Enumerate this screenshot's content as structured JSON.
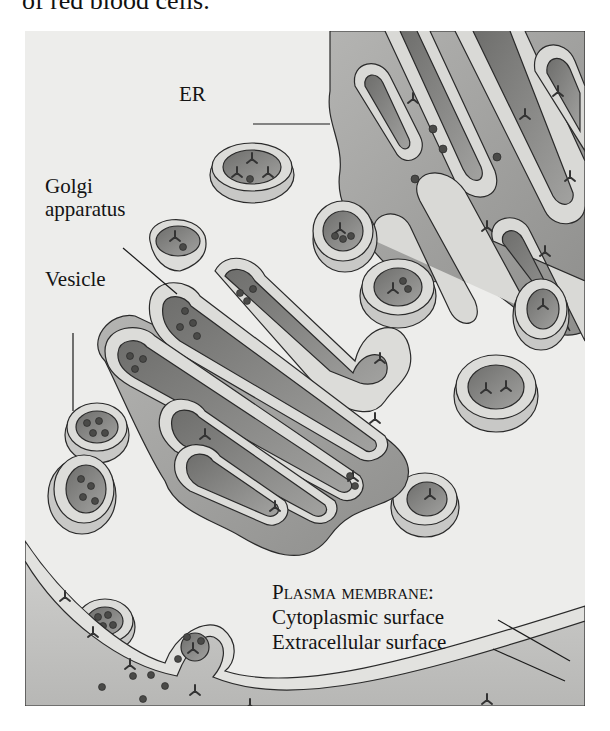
{
  "page": {
    "top_text": "of red blood cells."
  },
  "figure": {
    "background": "#ededeb",
    "organelle_fill": "#9d9d9b",
    "lumen_fill": "#7d7d7b",
    "membrane_fill": "#d9d9d6",
    "outline": "#2a2a2a",
    "labels": {
      "er": "ER",
      "golgi_line1": "Golgi",
      "golgi_line2": "apparatus",
      "vesicle": "Vesicle",
      "plasma_membrane": "Plasma membrane:",
      "cytoplasmic": "Cytoplasmic surface",
      "extracellular": "Extracellular surface"
    }
  }
}
